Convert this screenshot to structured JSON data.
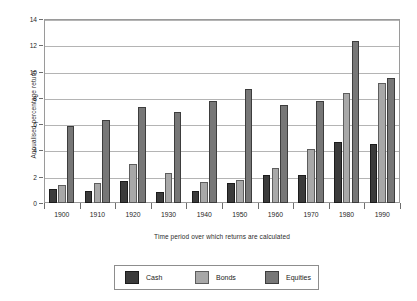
{
  "chart_data": {
    "type": "bar",
    "title": "",
    "xlabel": "Time period over which returns are calculated",
    "ylabel": "Annualised percentage return",
    "categories": [
      "1900",
      "1910",
      "1920",
      "1930",
      "1940",
      "1950",
      "1960",
      "1970",
      "1980",
      "1990"
    ],
    "series": [
      {
        "name": "Cash",
        "color": "#3b3b3b",
        "values": [
          1.1,
          0.9,
          1.7,
          0.85,
          0.9,
          1.5,
          2.15,
          2.1,
          4.65,
          4.5
        ]
      },
      {
        "name": "Bonds",
        "color": "#a8a8a8",
        "values": [
          1.35,
          1.55,
          3.0,
          2.25,
          1.6,
          1.75,
          2.65,
          4.1,
          8.35,
          9.1
        ]
      },
      {
        "name": "Equities",
        "color": "#777777",
        "values": [
          5.85,
          6.3,
          7.3,
          6.95,
          7.8,
          8.7,
          7.45,
          7.8,
          12.3,
          9.5
        ]
      }
    ],
    "ylim": [
      0,
      14
    ],
    "yticks": [
      0,
      2,
      4,
      6,
      8,
      10,
      12,
      14
    ],
    "ytick_labels": [
      "0",
      "2",
      "4",
      "6",
      "8",
      "10",
      "12",
      "14"
    ],
    "grid": true,
    "legend_position": "bottom-center"
  },
  "legend": {
    "entries": [
      {
        "label": "Cash"
      },
      {
        "label": "Bonds"
      },
      {
        "label": "Equities"
      }
    ]
  }
}
